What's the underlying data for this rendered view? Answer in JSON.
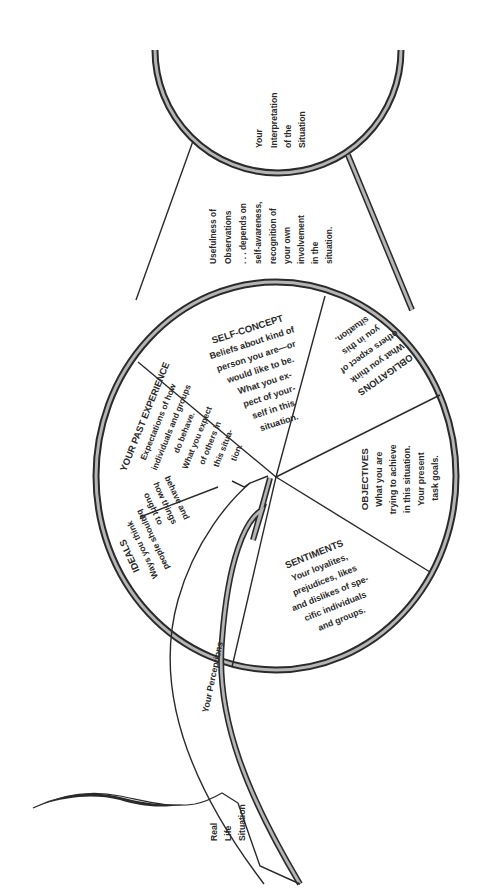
{
  "diagram": {
    "type": "perception-process-diagram",
    "orientation": "rotated 90 degrees counter-clockwise (text reads bottom-to-top)",
    "colors": {
      "ink": "#2a2a2a",
      "hatch": "#b5b5b5",
      "background": "#ffffff"
    },
    "interpretation": {
      "lines": [
        "Your",
        "Interpretation",
        "of the",
        "Situation"
      ]
    },
    "usefulness": {
      "lines": [
        "Usefulness of",
        "Observations",
        ". . . depends on",
        "self-awareness,",
        "recognition of",
        "your own",
        "involvement",
        "in the",
        "situation."
      ]
    },
    "segments": [
      {
        "id": "self-concept",
        "title": "SELF-CONCEPT",
        "lines": [
          "Beliefs about kind of",
          "person you are—or",
          "would like to be.",
          "What you ex-",
          "pect of your-",
          "self in this",
          "situation."
        ]
      },
      {
        "id": "obligations",
        "title": "OBLIGATIONS",
        "lines": [
          "What you think",
          "others expect of",
          "you in this",
          "situation."
        ]
      },
      {
        "id": "objectives",
        "title": "OBJECTIVES",
        "lines": [
          "What you are",
          "trying to achieve",
          "in this situation.",
          "Your present",
          "task goals."
        ]
      },
      {
        "id": "sentiments",
        "title": "SENTIMENTS",
        "lines": [
          "Your loyalites,",
          "prejudices, likes",
          "and dislikes of spe-",
          "cific individuals",
          "and groups."
        ]
      },
      {
        "id": "ideals",
        "title": "IDEALS",
        "lines": [
          "Ways you think",
          "people should",
          "behave and",
          "how things",
          "ought to",
          "be."
        ]
      },
      {
        "id": "past-experience",
        "title": "YOUR PAST EXPERIENCE",
        "lines": [
          "Expectations of how",
          "individuals and groups",
          "do behave.",
          "What you expect",
          "of others in",
          "this situa-",
          "tion."
        ]
      }
    ],
    "perceptions_arrow": {
      "label": "Your Perceptions"
    },
    "real_life": {
      "lines": [
        "Real",
        "Life",
        "Situation"
      ]
    }
  }
}
